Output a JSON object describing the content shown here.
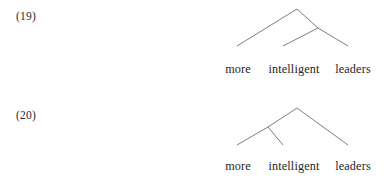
{
  "document": {
    "type": "syntax-tree-examples",
    "background_color": "#ffffff",
    "text_color": "#2b2b2b",
    "line_color": "#6e6e76"
  },
  "examples": [
    {
      "number": "(19)",
      "structure": "right-branching",
      "leaves": [
        {
          "text": "more"
        },
        {
          "text": "intelligent"
        },
        {
          "text": "leaders"
        }
      ]
    },
    {
      "number": "(20)",
      "structure": "left-branching",
      "leaves": [
        {
          "text": "more"
        },
        {
          "text": "intelligent"
        },
        {
          "text": "leaders"
        }
      ]
    }
  ]
}
